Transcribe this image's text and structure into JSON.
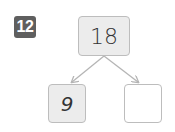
{
  "problem": {
    "number": "12",
    "badge_color": "#5f5f5f"
  },
  "number_bond": {
    "whole": "18",
    "parts": [
      {
        "value": "9",
        "filled": true
      },
      {
        "value": "",
        "filled": false
      }
    ],
    "box_fill": "#ececec",
    "box_border": "#bdbdbd",
    "arrow_color": "#b5b5b5"
  }
}
